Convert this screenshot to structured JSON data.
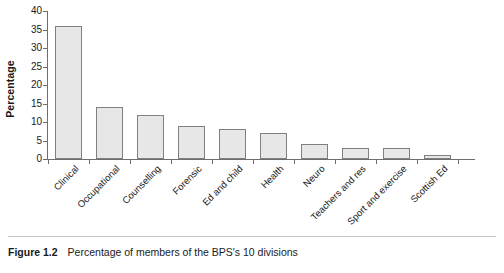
{
  "caption": {
    "number": "Figure 1.2",
    "text": "Percentage of members of the BPS's 10 divisions"
  },
  "chart_data": {
    "type": "bar",
    "title": "",
    "xlabel": "",
    "ylabel": "Percentage",
    "ylim": [
      0,
      40
    ],
    "yticks": [
      0,
      5,
      10,
      15,
      20,
      25,
      30,
      35,
      40
    ],
    "ytick_labels": [
      "0",
      "5",
      "10",
      "15",
      "20",
      "25",
      "30",
      "35",
      "40"
    ],
    "grid": false,
    "legend": false,
    "bar_fill_color": "#e7e7e7",
    "bar_edge_color": "#808080",
    "axis_color": "#6e6e6e",
    "background_color": "#ffffff",
    "categories": [
      "Clinical",
      "Occupational",
      "Counselling",
      "Forensic",
      "Ed and child",
      "Health",
      "Neuro",
      "Teachers and res",
      "Sport and exercise",
      "Scottish Ed"
    ],
    "values": [
      36,
      14,
      12,
      9,
      8,
      7,
      4,
      3,
      3,
      1
    ]
  }
}
